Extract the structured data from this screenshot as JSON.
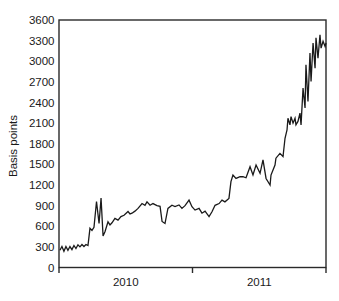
{
  "chart_data": {
    "type": "line",
    "title": "",
    "xlabel": "",
    "ylabel": "Basis points",
    "xlim": [
      2010,
      2012
    ],
    "ylim": [
      0,
      3600
    ],
    "grid": false,
    "legend": "none",
    "yticks": [
      0,
      300,
      600,
      900,
      1200,
      1500,
      1800,
      2100,
      2400,
      2700,
      3000,
      3300,
      3600
    ],
    "xticks": [
      2010,
      2011,
      2012
    ],
    "x_period_labels": [
      "2010",
      "2011"
    ],
    "line_color": "#1a1a1a",
    "axis_color": "#2a2a2a",
    "text_color": "#1a1a1a",
    "series": [
      {
        "name": "basis-points-spread",
        "x": [
          2010.007,
          2010.022,
          2010.037,
          2010.052,
          2010.067,
          2010.082,
          2010.097,
          2010.112,
          2010.127,
          2010.142,
          2010.157,
          2010.172,
          2010.187,
          2010.202,
          2010.217,
          2010.232,
          2010.247,
          2010.262,
          2010.281,
          2010.3,
          2010.315,
          2010.33,
          2010.345,
          2010.367,
          2010.382,
          2010.397,
          2010.419,
          2010.442,
          2010.464,
          2010.487,
          2010.517,
          2010.532,
          2010.547,
          2010.569,
          2010.592,
          2010.622,
          2010.644,
          2010.659,
          2010.682,
          2010.704,
          2010.734,
          2010.757,
          2010.772,
          2010.794,
          2010.816,
          2010.846,
          2010.869,
          2010.899,
          2010.921,
          2010.944,
          2010.974,
          2010.996,
          2011.019,
          2011.049,
          2011.071,
          2011.094,
          2011.124,
          2011.146,
          2011.169,
          2011.199,
          2011.221,
          2011.243,
          2011.273,
          2011.288,
          2011.303,
          2011.326,
          2011.356,
          2011.378,
          2011.401,
          2011.431,
          2011.453,
          2011.476,
          2011.506,
          2011.528,
          2011.551,
          2011.581,
          2011.588,
          2011.618,
          2011.625,
          2011.655,
          2011.678,
          2011.693,
          2011.708,
          2011.715,
          2011.73,
          2011.738,
          2011.753,
          2011.768,
          2011.775,
          2011.79,
          2011.805,
          2011.813,
          2011.828,
          2011.843,
          2011.85,
          2011.865,
          2011.88,
          2011.888,
          2011.903,
          2011.918,
          2011.925,
          2011.94,
          2011.955,
          2011.963,
          2011.978,
          2011.993,
          2012.0
        ],
        "y": [
          250,
          305,
          235,
          305,
          250,
          305,
          260,
          320,
          275,
          330,
          300,
          335,
          305,
          335,
          320,
          570,
          540,
          585,
          960,
          640,
          1010,
          460,
          525,
          665,
          620,
          650,
          715,
          690,
          740,
          760,
          815,
          780,
          790,
          820,
          860,
          930,
          905,
          955,
          905,
          930,
          900,
          890,
          670,
          640,
          860,
          905,
          885,
          910,
          860,
          900,
          980,
          885,
          835,
          860,
          790,
          820,
          740,
          810,
          905,
          930,
          980,
          955,
          1005,
          1250,
          1345,
          1295,
          1320,
          1320,
          1305,
          1465,
          1345,
          1490,
          1370,
          1565,
          1295,
          1200,
          1345,
          1490,
          1590,
          1660,
          1615,
          1880,
          2000,
          2170,
          2075,
          2195,
          2100,
          2170,
          2075,
          2125,
          2245,
          2075,
          2610,
          2320,
          2950,
          2415,
          3120,
          2705,
          3265,
          2900,
          3340,
          3045,
          3385,
          3190,
          3290,
          3215,
          3265
        ]
      }
    ]
  }
}
